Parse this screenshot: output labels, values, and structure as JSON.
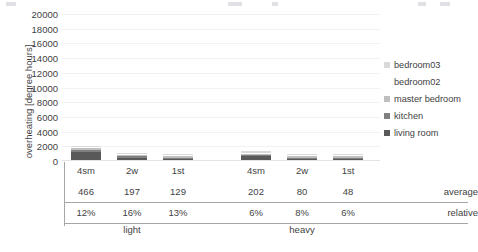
{
  "axis": {
    "y_title": "overheating [degree hours]",
    "y_ticks": [
      "20000",
      "18000",
      "16000",
      "14000",
      "12000",
      "10000",
      "8000",
      "6000",
      "4000",
      "2000",
      "0"
    ]
  },
  "legend": {
    "items": [
      {
        "label": "bedroom03",
        "color": "#d9d9d9"
      },
      {
        "label": "bedroom02",
        "color": "#ffffff"
      },
      {
        "label": "master bedroom",
        "color": "#bfbfbf"
      },
      {
        "label": "kitchen",
        "color": "#808080"
      },
      {
        "label": "living room",
        "color": "#595959"
      }
    ]
  },
  "table": {
    "categories": [
      "4sm",
      "2w",
      "1st",
      "4sm",
      "2w",
      "1st"
    ],
    "rows": [
      {
        "label": "average",
        "values": [
          "466",
          "197",
          "129",
          "202",
          "80",
          "48"
        ]
      },
      {
        "label": "relative",
        "values": [
          "12%",
          "16%",
          "13%",
          "6%",
          "8%",
          "6%"
        ]
      }
    ],
    "groups": [
      "light",
      "heavy"
    ]
  },
  "chart_data": {
    "type": "bar",
    "title": "",
    "xlabel": "",
    "ylabel": "overheating [degree hours]",
    "ylim": [
      0,
      20000
    ],
    "grid": true,
    "stacked": true,
    "legend_position": "right",
    "groups": [
      "light",
      "heavy"
    ],
    "categories": [
      "4sm",
      "2w",
      "1st",
      "4sm",
      "2w",
      "1st"
    ],
    "series": [
      {
        "name": "living room",
        "color": "#595959",
        "values": [
          1150,
          330,
          180,
          520,
          150,
          70
        ]
      },
      {
        "name": "kitchen",
        "color": "#808080",
        "values": [
          180,
          60,
          30,
          90,
          30,
          15
        ]
      },
      {
        "name": "master bedroom",
        "color": "#bfbfbf",
        "values": [
          260,
          70,
          35,
          110,
          35,
          18
        ]
      },
      {
        "name": "bedroom02",
        "color": "#ffffff",
        "values": [
          140,
          40,
          20,
          60,
          20,
          10
        ]
      },
      {
        "name": "bedroom03",
        "color": "#d9d9d9",
        "values": [
          200,
          55,
          28,
          85,
          28,
          14
        ]
      }
    ],
    "totals": [
      1930,
      555,
      293,
      865,
      263,
      127
    ],
    "average": [
      466,
      197,
      129,
      202,
      80,
      48
    ],
    "relative": [
      "12%",
      "16%",
      "13%",
      "6%",
      "8%",
      "6%"
    ]
  }
}
